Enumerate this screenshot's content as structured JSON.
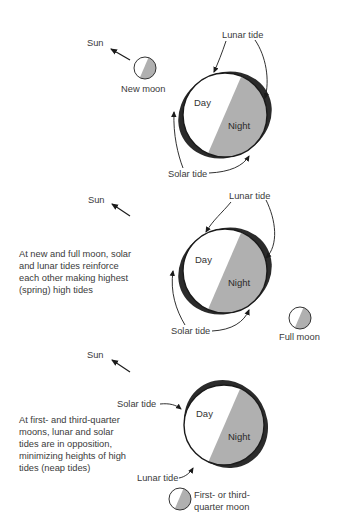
{
  "colors": {
    "background": "#ffffff",
    "night": "#b0b0b0",
    "day": "#ffffff",
    "tide_bulge": "#2b2b2b",
    "outline": "#1a1a1a",
    "text": "#3a3a3a"
  },
  "panels": [
    {
      "id": "new-moon",
      "sun_label": "Sun",
      "moon_label": "New moon",
      "lunar_tide_label": "Lunar tide",
      "solar_tide_label": "Solar tide",
      "day_label": "Day",
      "night_label": "Night",
      "caption": []
    },
    {
      "id": "full-moon",
      "sun_label": "Sun",
      "moon_label": "Full moon",
      "lunar_tide_label": "Lunar tide",
      "solar_tide_label": "Solar tide",
      "day_label": "Day",
      "night_label": "Night",
      "caption": [
        "At new and full moon, solar",
        "and lunar tides reinforce",
        "each other making highest",
        "(spring) high tides"
      ]
    },
    {
      "id": "quarter-moon",
      "sun_label": "Sun",
      "moon_label": [
        "First- or third-",
        "quarter moon"
      ],
      "lunar_tide_label": "Lunar tide",
      "solar_tide_label": "Solar tide",
      "day_label": "Day",
      "night_label": "Night",
      "caption": [
        "At first- and third-quarter",
        "moons, lunar and solar",
        "tides are in opposition,",
        "minimizing heights of high",
        "tides (neap tides)"
      ]
    }
  ]
}
